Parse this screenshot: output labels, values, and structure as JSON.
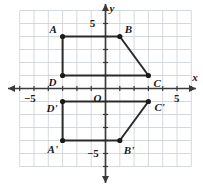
{
  "figure": {
    "axis_labels": {
      "x": "x",
      "y": "y",
      "origin": "O"
    },
    "tick_labels": {
      "x_negative": "−5",
      "x_positive": "5",
      "y_positive": "5",
      "y_negative": "−5"
    },
    "colors": {
      "grid": "#c9cfd6",
      "axis": "#3a3a3a",
      "shape": "#2b2b2b",
      "point": "#1a1a1a",
      "background": "#ffffff"
    },
    "grid": {
      "x_min": -6,
      "x_max": 6,
      "y_min": -6,
      "y_max": 6,
      "spacing": 1
    },
    "vertices": [
      {
        "name": "A",
        "x": -3,
        "y": 4,
        "label_dx": -13,
        "label_dy": -13
      },
      {
        "name": "B",
        "x": 1,
        "y": 4,
        "label_dx": 5,
        "label_dy": -13
      },
      {
        "name": "C",
        "x": 3,
        "y": 1,
        "label_dx": 5,
        "label_dy": 2
      },
      {
        "name": "D",
        "x": -3,
        "y": 1,
        "label_dx": -14,
        "label_dy": 1
      },
      {
        "name": "A'",
        "x": -3,
        "y": -4,
        "label_dx": -15,
        "label_dy": 3
      },
      {
        "name": "B'",
        "x": 1,
        "y": -4,
        "label_dx": 4,
        "label_dy": 4
      },
      {
        "name": "C'",
        "x": 3,
        "y": -1,
        "label_dx": 6,
        "label_dy": 0
      },
      {
        "name": "D'",
        "x": -3,
        "y": -1,
        "label_dx": -16,
        "label_dy": 1
      }
    ],
    "polygons": [
      {
        "name": "trapezoid-ABCD",
        "vertices": [
          "A",
          "B",
          "C",
          "D"
        ]
      },
      {
        "name": "trapezoid-A'B'C'D'",
        "vertices": [
          "A'",
          "B'",
          "C'",
          "D'"
        ]
      }
    ]
  }
}
